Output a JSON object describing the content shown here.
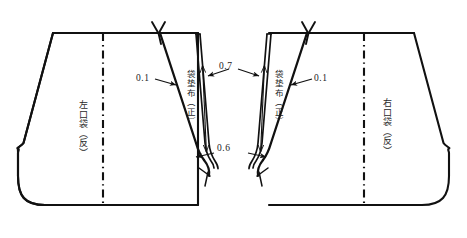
{
  "diagram": {
    "stroke_color": "#111111",
    "background_color": "#ffffff",
    "pieces": [
      {
        "id": "left-pocket",
        "label": "左口袋（反）",
        "side": "left"
      },
      {
        "id": "right-pocket",
        "label": "右口袋（反）",
        "side": "right"
      }
    ],
    "facings": [
      {
        "id": "left-facing",
        "label": "袋垫布（正）"
      },
      {
        "id": "right-facing",
        "label": "袋垫布（正）"
      }
    ],
    "dimensions": [
      {
        "id": "left-seam-allowance",
        "value": "0.1"
      },
      {
        "id": "left-facing-width",
        "value": "0.7"
      },
      {
        "id": "bottom-allowance",
        "value": "0.6"
      },
      {
        "id": "right-seam-allowance",
        "value": "0.1"
      }
    ],
    "notch_marks": [
      {
        "id": "left-top-notch"
      },
      {
        "id": "right-top-notch"
      }
    ],
    "center_lines": [
      {
        "id": "left-center-line",
        "style": "dash-dot"
      },
      {
        "id": "right-center-line",
        "style": "dash-dot"
      }
    ]
  }
}
